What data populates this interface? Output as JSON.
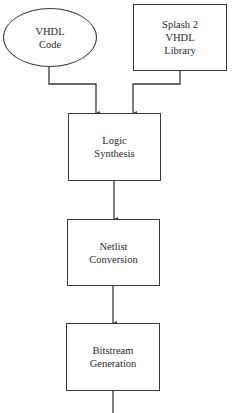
{
  "diagram": {
    "type": "flowchart",
    "direction": "top-to-bottom",
    "nodes": [
      {
        "id": "vhdl_code",
        "shape": "ellipse",
        "lines": [
          "VHDL",
          "Code"
        ]
      },
      {
        "id": "splash2_lib",
        "shape": "rectangle",
        "lines": [
          "Splash 2",
          "VHDL",
          "Library"
        ]
      },
      {
        "id": "logic_synthesis",
        "shape": "rectangle",
        "lines": [
          "Logic",
          "Synthesis"
        ]
      },
      {
        "id": "netlist_conversion",
        "shape": "rectangle",
        "lines": [
          "Netlist",
          "Conversion"
        ]
      },
      {
        "id": "bitstream_generation",
        "shape": "rectangle",
        "lines": [
          "Bitstream",
          "Generation"
        ]
      }
    ],
    "edges": [
      {
        "from": "vhdl_code",
        "to": "logic_synthesis"
      },
      {
        "from": "splash2_lib",
        "to": "logic_synthesis"
      },
      {
        "from": "logic_synthesis",
        "to": "netlist_conversion"
      },
      {
        "from": "netlist_conversion",
        "to": "bitstream_generation"
      },
      {
        "from": "bitstream_generation",
        "to": "continues-below"
      }
    ],
    "colors": {
      "stroke": "#3a3a3a",
      "background": "#ffffff",
      "text": "#2a2a2a"
    }
  }
}
